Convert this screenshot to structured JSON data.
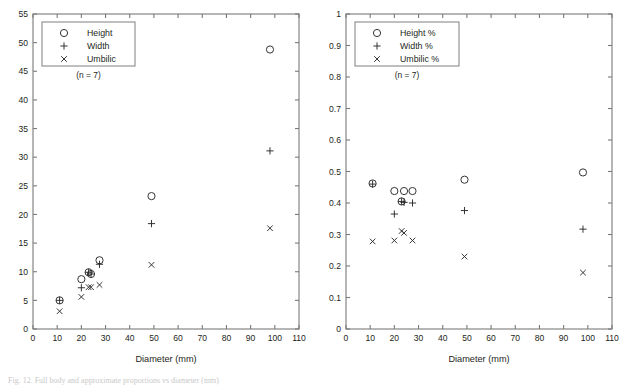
{
  "figure": {
    "background": "#ffffff",
    "marker_color": "#2b2b2b",
    "axis_color": "#7a7a7a",
    "caption_partial": "Fig. 12. Full body and approximate proportions vs diameter (mm)"
  },
  "panels": [
    {
      "id": "absolute",
      "legend": {
        "entries": [
          {
            "marker": "circle-marker",
            "glyph": "○",
            "label": "Height"
          },
          {
            "marker": "plus-marker",
            "glyph": "+",
            "label": "Width"
          },
          {
            "marker": "cross-marker",
            "glyph": "×",
            "label": "Umbilic"
          }
        ],
        "sample_note": "(n = 7)"
      },
      "chart_data": {
        "type": "scatter",
        "title": "",
        "xlabel": "Diameter (mm)",
        "ylabel": "",
        "xlim": [
          0,
          110
        ],
        "ylim": [
          0,
          55
        ],
        "xticks": [
          0,
          10,
          20,
          30,
          40,
          50,
          60,
          70,
          80,
          90,
          100,
          110
        ],
        "yticks": [
          0,
          5,
          10,
          15,
          20,
          25,
          30,
          35,
          40,
          45,
          50,
          55
        ],
        "xticklabels": [
          "0",
          "10",
          "20",
          "30",
          "40",
          "50",
          "60",
          "70",
          "80",
          "90",
          "100",
          "110"
        ],
        "yticklabels": [
          "0",
          "5",
          "10",
          "15",
          "20",
          "25",
          "30",
          "35",
          "40",
          "45",
          "50",
          "55"
        ],
        "grid": false,
        "legend_position": "upper-left",
        "x": [
          11,
          20,
          23,
          24,
          27.5,
          49,
          98
        ],
        "series": [
          {
            "name": "Height",
            "marker": "circle",
            "values": [
              5.0,
              8.7,
              9.9,
              9.6,
              12.0,
              23.2,
              48.8
            ]
          },
          {
            "name": "Width",
            "marker": "plus",
            "values": [
              5.0,
              7.2,
              9.9,
              9.6,
              11.3,
              18.4,
              31.1
            ]
          },
          {
            "name": "Umbilic",
            "marker": "cross",
            "values": [
              3.1,
              5.6,
              7.3,
              7.3,
              7.7,
              11.2,
              17.6
            ]
          }
        ]
      }
    },
    {
      "id": "relative",
      "legend": {
        "entries": [
          {
            "marker": "circle-marker",
            "glyph": "○",
            "label": "Height %"
          },
          {
            "marker": "plus-marker",
            "glyph": "+",
            "label": "Width %"
          },
          {
            "marker": "cross-marker",
            "glyph": "×",
            "label": "Umbilic %"
          }
        ],
        "sample_note": "(n = 7)"
      },
      "chart_data": {
        "type": "scatter",
        "title": "",
        "xlabel": "Diameter (mm)",
        "ylabel": "",
        "xlim": [
          0,
          110
        ],
        "ylim": [
          0,
          1
        ],
        "xticks": [
          0,
          10,
          20,
          30,
          40,
          50,
          60,
          70,
          80,
          90,
          100,
          110
        ],
        "yticks": [
          0,
          0.1,
          0.2,
          0.3,
          0.4,
          0.5,
          0.6,
          0.7,
          0.8,
          0.9,
          1
        ],
        "xticklabels": [
          "0",
          "10",
          "20",
          "30",
          "40",
          "50",
          "60",
          "70",
          "80",
          "90",
          "100",
          "110"
        ],
        "yticklabels": [
          "0",
          "0.1",
          "0.2",
          "0.3",
          "0.4",
          "0.5",
          "0.6",
          "0.7",
          "0.8",
          "0.9",
          "1"
        ],
        "grid": false,
        "legend_position": "upper-left",
        "x": [
          11,
          20,
          23,
          24,
          27.5,
          49,
          98
        ],
        "series": [
          {
            "name": "Height %",
            "marker": "circle",
            "values": [
              0.462,
              0.438,
              0.405,
              0.438,
              0.438,
              0.474,
              0.497
            ]
          },
          {
            "name": "Width %",
            "marker": "plus",
            "values": [
              0.46,
              0.365,
              0.405,
              0.402,
              0.4,
              0.376,
              0.317
            ]
          },
          {
            "name": "Umbilic %",
            "marker": "cross",
            "values": [
              0.278,
              0.281,
              0.311,
              0.305,
              0.281,
              0.23,
              0.179
            ]
          }
        ]
      }
    }
  ]
}
